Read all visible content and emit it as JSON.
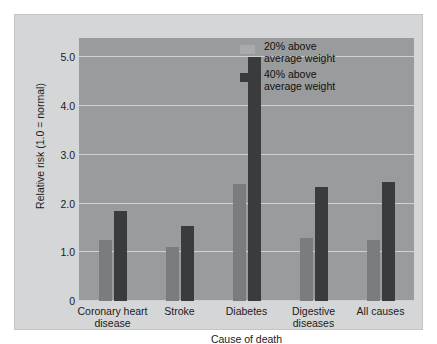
{
  "chart_data": {
    "type": "bar",
    "title": "",
    "xlabel": "Cause of death",
    "ylabel": "Relative risk (1.0 = normal)",
    "categories": [
      "Coronary heart disease",
      "Stroke",
      "Diabetes",
      "Digestive diseases",
      "All causes"
    ],
    "category_lines": [
      [
        "Coronary heart",
        "disease"
      ],
      [
        "Stroke",
        ""
      ],
      [
        "Diabetes",
        ""
      ],
      [
        "Digestive",
        "diseases"
      ],
      [
        "All causes",
        ""
      ]
    ],
    "series": [
      {
        "name": "20% above average weight",
        "name_lines": [
          "20% above",
          "average weight"
        ],
        "color": "#7b7c7d",
        "legend_color": "#a9aaab",
        "values": [
          1.25,
          1.1,
          2.4,
          1.3,
          1.25
        ]
      },
      {
        "name": "40% above average weight",
        "name_lines": [
          "40% above",
          "average weight"
        ],
        "color": "#3a3b3c",
        "legend_color": "#3a3b3c",
        "values": [
          1.85,
          1.55,
          5.0,
          2.35,
          2.45
        ]
      }
    ],
    "ylim": [
      0,
      5.4
    ],
    "yticks": [
      0,
      1.0,
      2.0,
      3.0,
      4.0,
      5.0
    ],
    "ytick_labels": [
      "0",
      "1.0",
      "2.0",
      "3.0",
      "4.0",
      "5.0"
    ],
    "grid": true,
    "legend_position": "top-right",
    "colors": {
      "figure_background": "#d5d6d7",
      "plot_background": "#9a9b9c",
      "gridline": "#cfd0d1",
      "text": "#1b1b1b"
    }
  }
}
